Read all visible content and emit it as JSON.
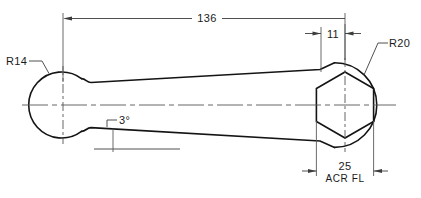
{
  "drawing": {
    "title": "Connecting rod / link engineering drawing",
    "type": "mechanical-orthographic-view",
    "units_note": "",
    "line_color": "#141414",
    "dimension_color": "#3c3c3c",
    "centerline_color": "#555555",
    "background": "#ffffff"
  },
  "annotations": {
    "radius_left": {
      "label": "R14",
      "value": 14,
      "kind": "radius",
      "leader": true
    },
    "radius_right": {
      "label": "R20",
      "value": 20,
      "kind": "radius",
      "leader": true
    },
    "length_overall": {
      "label": "136",
      "value": 136,
      "kind": "linear-dimension",
      "position": "top"
    },
    "offset_right": {
      "label": "11",
      "value": 11,
      "kind": "linear-dimension",
      "position": "top-right"
    },
    "taper_angle": {
      "label": "3°",
      "value": 3,
      "kind": "angular-dimension",
      "position": "lower-left"
    },
    "flat_width": {
      "label": "25",
      "value": 25,
      "kind": "linear-dimension",
      "position": "bottom-right"
    },
    "flat_note": {
      "label": "ACR  FL",
      "kind": "note",
      "position": "bottom-right"
    }
  },
  "geometry": {
    "left_boss": {
      "shape": "circle",
      "cx": 63,
      "cy": 105,
      "r": 33
    },
    "right_boss": {
      "shape": "circle",
      "cx": 345,
      "cy": 105,
      "r": 40
    },
    "right_hex": {
      "shape": "hexagon",
      "cx": 345,
      "cy": 105,
      "r": 33
    },
    "body": {
      "shape": "tapered-beam",
      "taper_deg": 3
    }
  }
}
